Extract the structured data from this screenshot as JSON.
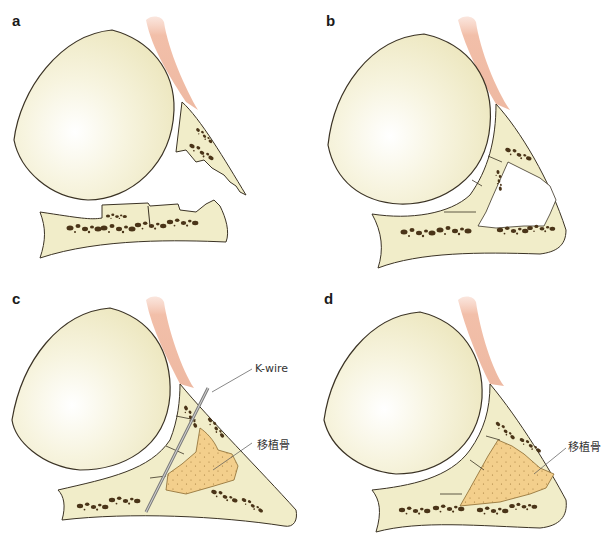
{
  "panels": [
    {
      "id": "a",
      "label": "a"
    },
    {
      "id": "b",
      "label": "b"
    },
    {
      "id": "c",
      "label": "c",
      "callouts": [
        "K-wire",
        "移植骨"
      ]
    },
    {
      "id": "d",
      "label": "d",
      "callouts": [
        "移植骨"
      ]
    }
  ],
  "colors": {
    "bone": "#f1edc9",
    "bone_outline": "#3b3325",
    "marrow": "#4a3418",
    "tendon": "#f2c2b0",
    "graft": "#f3cf8c",
    "kwire": "#8a8a8a"
  }
}
